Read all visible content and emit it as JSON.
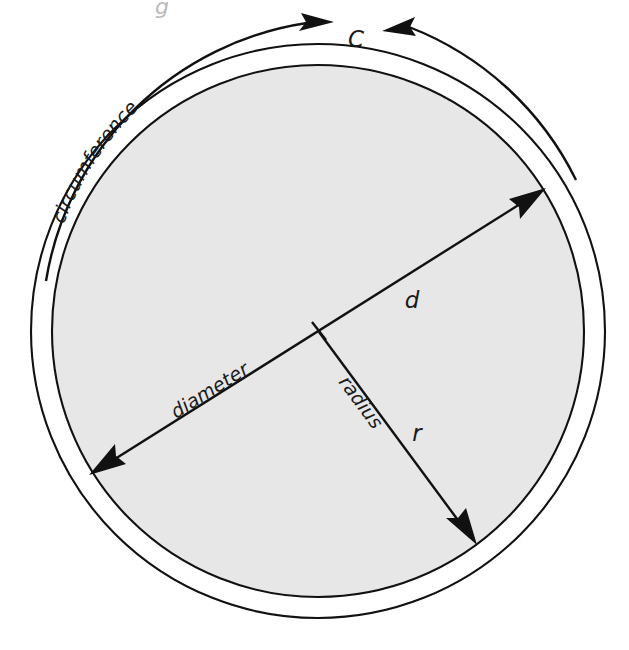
{
  "figure": {
    "kind": "circle-geometry-diagram",
    "background_color": "#ffffff",
    "ink_color": "#111111",
    "disc_fill_color": "#e7e7e7",
    "ring_fill_color": "#ffffff"
  },
  "top_fragment": {
    "text": "g",
    "note": "faint cropped glyph from text above the figure"
  },
  "labels": {
    "circumference_word": "circumference",
    "circumference_symbol": "C",
    "diameter_word": "diameter",
    "diameter_symbol": "d",
    "radius_word": "radius",
    "radius_symbol": "r"
  },
  "geometry": {
    "center": {
      "x": 318,
      "y": 331
    },
    "inner_radius": 266,
    "outer_radius": 287,
    "diameter_endpoint_a": {
      "x": 94,
      "y": 472
    },
    "diameter_endpoint_b": {
      "x": 541,
      "y": 191
    },
    "radius_endpoint": {
      "x": 473,
      "y": 539
    },
    "circumference_arc_radius": 311
  },
  "label_positions": {
    "circumference_symbol": {
      "x": 356,
      "y": 47
    },
    "diameter_symbol": {
      "x": 412,
      "y": 308
    },
    "radius_symbol": {
      "x": 417,
      "y": 441
    },
    "diameter_word": {
      "x": 262,
      "y": 329,
      "rotation_deg": -32
    },
    "radius_word": {
      "x": 366,
      "y": 438,
      "rotation_deg": 66
    }
  }
}
